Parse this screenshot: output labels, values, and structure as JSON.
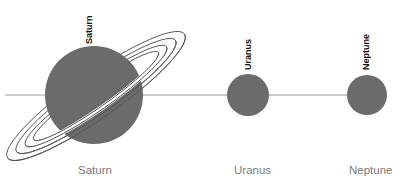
{
  "diagram": {
    "colors": {
      "planet_fill": "#6b6b6b",
      "axis_line": "#9a9a9a",
      "ring_stroke": "#555555",
      "top_label": "#111111",
      "bottom_label": "#7a7a7a"
    },
    "planets": [
      {
        "name": "Saturn",
        "top_label": "Saturn",
        "bottom_label": "Saturn",
        "has_rings": true
      },
      {
        "name": "Uranus",
        "top_label": "Uranus",
        "bottom_label": "Uranus",
        "has_rings": false
      },
      {
        "name": "Neptune",
        "top_label": "Neptune",
        "bottom_label": "Neptune",
        "has_rings": false
      }
    ]
  }
}
